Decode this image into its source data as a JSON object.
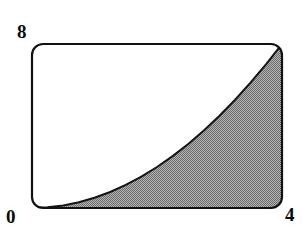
{
  "figure": {
    "kind": "area-under-curve-plot",
    "background_color": "#ffffff",
    "frame": {
      "stroke_color": "#111111",
      "stroke_width": 2.2,
      "corner_radius": 11,
      "x_left_px": 32,
      "x_right_px": 282,
      "y_top_px": 44,
      "y_bottom_px": 208
    },
    "shading": {
      "style": "dithered-halftone",
      "fill_color": "#9a9a9a",
      "dot_color": "#6e6e6e",
      "coverage": "50%"
    },
    "curve": {
      "stroke_color": "#141414",
      "stroke_width": 2.0
    }
  },
  "labels": {
    "y_max": "8",
    "origin": "0",
    "x_max": "4"
  },
  "chart_data": {
    "type": "area",
    "title": "",
    "subtitle": "",
    "xlabel": "",
    "ylabel": "",
    "xlim": [
      0,
      4
    ],
    "ylim": [
      0,
      8
    ],
    "grid": false,
    "legend": null,
    "xticks": [
      "0",
      "4"
    ],
    "yticks": [
      "0",
      "8"
    ],
    "annotations": [],
    "series": [
      {
        "name": "y = x^2 / 2",
        "fill": "shaded",
        "x": [
          0,
          0.25,
          0.5,
          0.75,
          1,
          1.25,
          1.5,
          1.75,
          2,
          2.25,
          2.5,
          2.75,
          3,
          3.25,
          3.5,
          3.75,
          4
        ],
        "values": [
          0,
          0.031,
          0.125,
          0.281,
          0.5,
          0.781,
          1.125,
          1.531,
          2,
          2.531,
          3.125,
          3.781,
          4.5,
          5.281,
          6.125,
          7.031,
          8
        ]
      }
    ]
  }
}
